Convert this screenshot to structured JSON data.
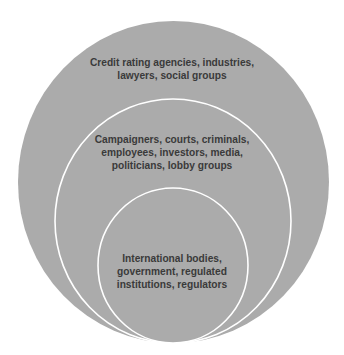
{
  "diagram": {
    "type": "nested-circles",
    "colors": {
      "fill": "#ababab",
      "outline": "#ffffff",
      "text": "#3a3a3a",
      "background": "#ffffff"
    },
    "rings": [
      {
        "level": "outer",
        "lines": [
          "Credit rating agencies, industries,",
          "lawyers, social groups"
        ]
      },
      {
        "level": "middle",
        "lines": [
          "Campaigners, courts, criminals,",
          "employees, investors, media,",
          "politicians, lobby groups"
        ]
      },
      {
        "level": "inner",
        "lines": [
          "International bodies,",
          "government, regulated",
          "institutions, regulators"
        ]
      }
    ]
  }
}
